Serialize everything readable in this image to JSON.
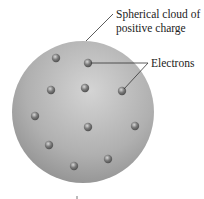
{
  "diagram": {
    "labels": {
      "cloud_line1": "Spherical cloud of",
      "cloud_line2": "positive charge",
      "electrons": "Electrons"
    },
    "sphere": {
      "cx": 83,
      "cy": 112,
      "r": 71,
      "color": "#a8a8a8"
    },
    "electrons": [
      {
        "x": 56,
        "y": 58
      },
      {
        "x": 88,
        "y": 63
      },
      {
        "x": 51,
        "y": 90
      },
      {
        "x": 85,
        "y": 88
      },
      {
        "x": 122,
        "y": 91
      },
      {
        "x": 35,
        "y": 116
      },
      {
        "x": 88,
        "y": 127
      },
      {
        "x": 135,
        "y": 126
      },
      {
        "x": 49,
        "y": 145
      },
      {
        "x": 108,
        "y": 159
      },
      {
        "x": 74,
        "y": 166
      }
    ]
  }
}
